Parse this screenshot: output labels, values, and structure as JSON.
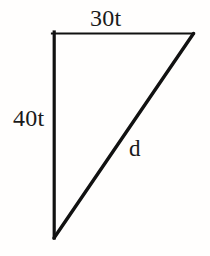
{
  "figure": {
    "type": "right-triangle-diagram",
    "background_color": "#fffefd",
    "stroke_color": "#111111",
    "labels": {
      "top_side": "30t",
      "left_side": "40t",
      "hypotenuse": "d"
    },
    "geometry": {
      "vertex_top_left": [
        53,
        33
      ],
      "vertex_top_right": [
        193,
        33
      ],
      "vertex_bottom_left": [
        54,
        237
      ],
      "top_side_width_px": 140,
      "left_side_height_px": 204,
      "top_stroke_width_px": 2.2,
      "left_stroke_width_px": 3.2,
      "hypotenuse_stroke_width_px": 3.4
    }
  }
}
